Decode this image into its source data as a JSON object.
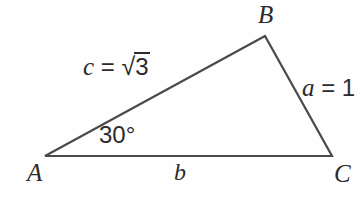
{
  "figure": {
    "type": "triangle-diagram",
    "background_color": "#fefefe",
    "stroke_color": "#4a4a4a",
    "text_color": "#2b2b2b",
    "stroke_width": 2.2
  },
  "vertices": {
    "a": {
      "label": "A",
      "x": 45,
      "y": 156
    },
    "b": {
      "label": "B",
      "x": 265,
      "y": 36
    },
    "c": {
      "label": "C",
      "x": 332,
      "y": 156
    }
  },
  "sides": {
    "c": {
      "variable": "c",
      "equals": "=",
      "radical_sign": "√",
      "radicand": "3",
      "full_text": "c = √3",
      "between": "A-B"
    },
    "a": {
      "variable": "a",
      "equals": "=",
      "value": "1",
      "full_text": "a = 1",
      "between": "B-C"
    },
    "b": {
      "variable": "b",
      "full_text": "b",
      "between": "A-C"
    }
  },
  "angles": {
    "at_a": {
      "value": "30",
      "unit": "°",
      "full_text": "30°",
      "vertex": "A"
    }
  }
}
